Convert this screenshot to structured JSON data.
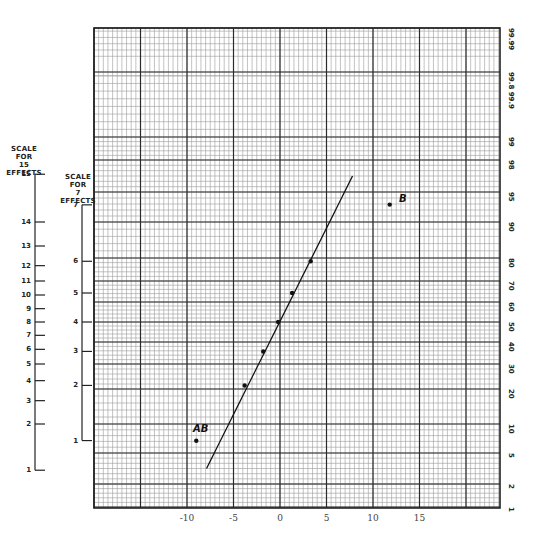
{
  "chart_data": {
    "type": "scatter",
    "xlabel": "",
    "ylabel": "Cumulative probability (%)",
    "grid": true,
    "x_ticks": [
      "-10",
      "-5",
      "0",
      "5",
      "10",
      "15"
    ],
    "x_tick_values": [
      -10,
      -5,
      0,
      5,
      10,
      15
    ],
    "xlim": [
      -19,
      25
    ],
    "probability_ticks": [
      "1",
      "2",
      "5",
      "10",
      "20",
      "30",
      "40",
      "50",
      "60",
      "70",
      "80",
      "90",
      "95",
      "98",
      "99",
      "99.8 99.9",
      "99.99"
    ],
    "probability_tick_values": [
      1,
      2,
      5,
      10,
      20,
      30,
      40,
      50,
      60,
      70,
      80,
      90,
      95,
      98,
      99,
      99.85,
      99.99
    ],
    "left_scales": [
      {
        "title": [
          "SCALE",
          "FOR",
          "15",
          "EFFECTS"
        ],
        "ticks": [
          "1",
          "2",
          "3",
          "4",
          "5",
          "6",
          "7",
          "8",
          "9",
          "10",
          "11",
          "12",
          "13",
          "14",
          "15"
        ]
      },
      {
        "title": [
          "SCALE",
          "FOR",
          "7",
          "EFFECTS"
        ],
        "ticks": [
          "1",
          "2",
          "3",
          "4",
          "5",
          "6",
          "7"
        ]
      }
    ],
    "points": [
      {
        "label": "AB",
        "x": -9.0,
        "rank_7": 1,
        "percent": 7.1
      },
      {
        "label": "",
        "x": -3.8,
        "rank_7": 2,
        "percent": 21.4
      },
      {
        "label": "",
        "x": -1.8,
        "rank_7": 3,
        "percent": 35.7
      },
      {
        "label": "",
        "x": -0.2,
        "rank_7": 4,
        "percent": 50.0
      },
      {
        "label": "",
        "x": 1.3,
        "rank_7": 5,
        "percent": 64.3
      },
      {
        "label": "",
        "x": 3.3,
        "rank_7": 6,
        "percent": 78.6
      },
      {
        "label": "B",
        "x": 11.8,
        "rank_7": 7,
        "percent": 92.9
      }
    ],
    "fitted_line": {
      "x_start": -7.9,
      "percent_start": 3.5,
      "x_end": 7.8,
      "percent_end": 96.5
    }
  },
  "labels": {
    "scale15": {
      "line1": "SCALE",
      "line2": "FOR",
      "line3": "15",
      "line4": "EFFECTS"
    },
    "scale7": {
      "line1": "SCALE",
      "line2": "FOR",
      "line3": "7",
      "line4": "EFFECTS"
    },
    "point_ab": "AB",
    "point_b": "B"
  }
}
